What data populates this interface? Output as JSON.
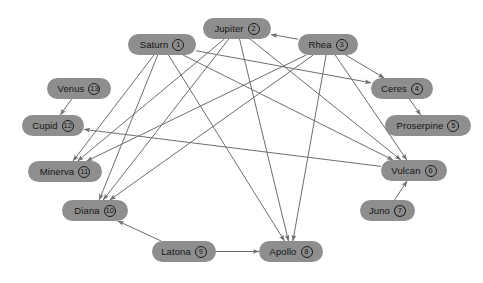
{
  "diagram": {
    "background_color": "#ffffff",
    "node_fill_color": "#8e8e8e",
    "node_text_color": "#151515",
    "edge_color": "#6e6e6e",
    "nodes": [
      {
        "id": "saturn",
        "label": "Saturn",
        "number": "1",
        "x": 128,
        "y": 34,
        "w": 68
      },
      {
        "id": "jupiter",
        "label": "Jupiter",
        "number": "2",
        "x": 203,
        "y": 18,
        "w": 68
      },
      {
        "id": "rhea",
        "label": "Rhea",
        "number": "3",
        "x": 298,
        "y": 34,
        "w": 60
      },
      {
        "id": "ceres",
        "label": "Ceres",
        "number": "4",
        "x": 371,
        "y": 78,
        "w": 62
      },
      {
        "id": "proserpine",
        "label": "Proserpine",
        "number": "5",
        "x": 385,
        "y": 115,
        "w": 86
      },
      {
        "id": "vulcan",
        "label": "Vulcan",
        "number": "6",
        "x": 381,
        "y": 160,
        "w": 66
      },
      {
        "id": "juno",
        "label": "Juno",
        "number": "7",
        "x": 360,
        "y": 200,
        "w": 55
      },
      {
        "id": "apollo",
        "label": "Apollo",
        "number": "8",
        "x": 259,
        "y": 241,
        "w": 64
      },
      {
        "id": "latona",
        "label": "Latona",
        "number": "9",
        "x": 152,
        "y": 241,
        "w": 64
      },
      {
        "id": "diana",
        "label": "Diana",
        "number": "10",
        "x": 62,
        "y": 200,
        "w": 66
      },
      {
        "id": "minerva",
        "label": "Minerva",
        "number": "11",
        "x": 28,
        "y": 161,
        "w": 74
      },
      {
        "id": "cupid",
        "label": "Cupid",
        "number": "12",
        "x": 22,
        "y": 115,
        "w": 62
      },
      {
        "id": "venus",
        "label": "Venus",
        "number": "13",
        "x": 47,
        "y": 78,
        "w": 64
      }
    ],
    "edges": [
      {
        "from": "saturn",
        "to": "minerva"
      },
      {
        "from": "saturn",
        "to": "diana"
      },
      {
        "from": "saturn",
        "to": "apollo"
      },
      {
        "from": "saturn",
        "to": "vulcan"
      },
      {
        "from": "saturn",
        "to": "ceres"
      },
      {
        "from": "jupiter",
        "to": "minerva"
      },
      {
        "from": "jupiter",
        "to": "diana"
      },
      {
        "from": "jupiter",
        "to": "apollo"
      },
      {
        "from": "jupiter",
        "to": "vulcan"
      },
      {
        "from": "rhea",
        "to": "jupiter"
      },
      {
        "from": "rhea",
        "to": "ceres"
      },
      {
        "from": "rhea",
        "to": "minerva"
      },
      {
        "from": "rhea",
        "to": "diana"
      },
      {
        "from": "rhea",
        "to": "apollo"
      },
      {
        "from": "rhea",
        "to": "vulcan"
      },
      {
        "from": "ceres",
        "to": "proserpine"
      },
      {
        "from": "vulcan",
        "to": "cupid"
      },
      {
        "from": "juno",
        "to": "vulcan"
      },
      {
        "from": "latona",
        "to": "apollo"
      },
      {
        "from": "latona",
        "to": "diana"
      },
      {
        "from": "venus",
        "to": "cupid"
      }
    ]
  }
}
